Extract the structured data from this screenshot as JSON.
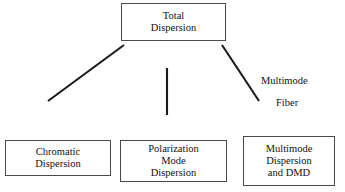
{
  "diagram": {
    "type": "hierarchy-tree",
    "colors": {
      "box_border": "#4a4a4a",
      "connector_line": "#1a1a1a",
      "text": "#111111",
      "background": "#ffffff"
    },
    "root": {
      "id": "total-dispersion",
      "label": "Total\nDispersion"
    },
    "children": [
      {
        "id": "chromatic-dispersion",
        "label": "Chromatic\nDispersion",
        "edge": "diagonal-left"
      },
      {
        "id": "polarization-mode-dispersion",
        "label": "Polarization\nMode\nDispersion",
        "edge": "vertical-center"
      },
      {
        "id": "multimode-dispersion-and-dmd",
        "label": "Multimode\nDispersion\nand DMD",
        "edge": "diagonal-right"
      }
    ],
    "edge_annotations": [
      {
        "id": "multimode-fiber-annotation",
        "line_one": "Multimode",
        "line_two": "Fiber",
        "attached_to": "diagonal-right"
      }
    ]
  }
}
